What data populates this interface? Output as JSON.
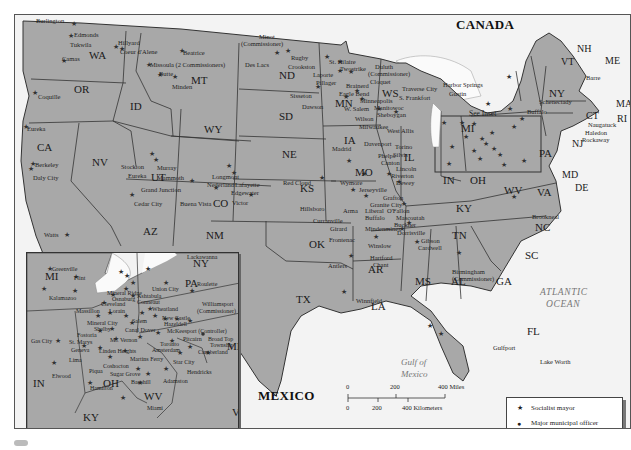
{
  "map": {
    "title": "Socialist municipal officials map of the United States",
    "colors": {
      "land_us": "#a8a8a8",
      "land_foreign": "#f2f2f2",
      "water": "#f7f7f7",
      "borders": "#333333",
      "text": "#222222",
      "ocean_label": "#777777"
    },
    "countries": {
      "canada": "CANADA",
      "mexico": "MEXICO"
    },
    "water_bodies": {
      "atlantic_1": "ATLANTIC",
      "atlantic_2": "OCEAN",
      "gulf_1": "Gulf of",
      "gulf_2": "Mexico"
    },
    "see_inset": "See Inset",
    "states": {
      "WA": "WA",
      "OR": "OR",
      "CA": "CA",
      "ID": "ID",
      "NV": "NV",
      "MT": "MT",
      "WY": "WY",
      "UT": "UT",
      "AZ": "AZ",
      "CO": "CO",
      "NM": "NM",
      "ND": "ND",
      "SD": "SD",
      "NE": "NE",
      "KS": "KS",
      "OK": "OK",
      "TX": "TX",
      "MN": "MN",
      "IA": "IA",
      "MO": "MO",
      "AR": "AR",
      "LA": "LA",
      "WS": "WS",
      "IL": "IL",
      "MI": "MI",
      "IN": "IN",
      "OH": "OH",
      "KY": "KY",
      "TN": "TN",
      "MS": "MS",
      "AL": "AL",
      "GA": "GA",
      "FL": "FL",
      "SC": "SC",
      "NC": "NC",
      "VA": "VA",
      "WV": "WV",
      "PA": "PA",
      "NY": "NY",
      "MD": "MD",
      "DE": "DE",
      "NJ": "NJ",
      "CT": "CT",
      "RI": "RI",
      "MA": "MA",
      "VT": "VT",
      "NH": "NH",
      "ME": "ME"
    },
    "cities": {
      "burlington": "Burlington",
      "edmonds": "Edmonds",
      "tukwila": "Tukwila",
      "camas": "Camas",
      "hillyard": "Hillyard",
      "coeur_d_alene": "Coeur d'Alene",
      "beatrice": "Beatrice",
      "missoula": "Missoula (2 Commissioners)",
      "butte": "Butte",
      "minden": "Minden",
      "coquille": "Coquille",
      "eureka_ca": "Eureka",
      "berkeley": "Berkeley",
      "daly_city": "Daly City",
      "watts": "Watts",
      "stockton": "Stockton",
      "murray": "Murray",
      "eureka_ut": "Eureka",
      "mammoth": "Mammoth",
      "grand_junction": "Grand Junction",
      "cedar_city": "Cedar City",
      "longmont": "Longmont",
      "nederland": "Nederland",
      "lafayette": "Lafayette",
      "edgewater": "Edgewater",
      "buena_vista": "Buena Vista",
      "victor": "Victor",
      "minot_1": "Minot",
      "minot_2": "(Commissioner)",
      "des_lacs": "Des Lacs",
      "rugby": "Rugby",
      "crookston": "Crookston",
      "st_hilaire": "St. Hilaire",
      "two_strike": "Twostrike",
      "laporte": "Laporte",
      "pillager": "Pillager",
      "brainerd": "Brainerd",
      "eagle_bend": "Eagle Bend",
      "sisseton": "Sisseton",
      "dawson": "Dawson",
      "minneapolis": "Minneapolis",
      "w_salem": "W. Salem",
      "duluth_1": "Duluth",
      "duluth_2": "(Commissioner)",
      "cloquet": "Cloquet",
      "traverse_city": "Traverse City",
      "s_frankfort": "S. Frankfort",
      "manitowoc": "Manitowoc",
      "sheboygan": "Sheboygan",
      "wilson": "Wilson",
      "milwaukee": "Milwaukee",
      "west_allis": "West Allis",
      "harbor_springs": "Harbor Springs",
      "gustin": "Gustin",
      "madrid": "Madrid",
      "davenport": "Davenport",
      "torino": "Torino",
      "sylvia": "Silvis",
      "phelps": "Phelps",
      "canton": "Canton",
      "lincoln": "Lincoln",
      "riverton": "Riverton",
      "dewey": "Dewey",
      "red_cloud": "Red Cloud",
      "wymore": "Wymore",
      "jerseyville": "Jerseyville",
      "grafton": "Grafton",
      "granite_city": "Granite City",
      "o_fallon": "O'Fallon",
      "liberal": "Liberal",
      "arma": "Arma",
      "buffalo_mo": "Buffalo",
      "mascoutah": "Mascoutah",
      "buckner": "Buckner",
      "dorrisville": "Dorrisville",
      "hillsboro": "Hillsboro",
      "curranville": "Curranville",
      "girard": "Girard",
      "mindenmines": "Mindenmines",
      "frontenac": "Frontenac",
      "winslow": "Winslow",
      "hartford": "Hartford",
      "chant": "Chant",
      "antlers": "Antlers",
      "gibson": "Gibson",
      "cardwell": "Cardwell",
      "winnfield": "Winnfield",
      "birmingham_1": "Birmingham",
      "birmingham_2": "(Commissioner)",
      "brookneal": "Brookneal",
      "gulfport": "Gulfport",
      "lake_worth": "Lake Worth",
      "schenectady": "Schenectady",
      "buffalo_ny": "Buffalo",
      "barre": "Barre",
      "naugatuck": "Naugatuck",
      "haledon": "Haledon",
      "rockaway": "Rockaway"
    },
    "inset": {
      "states": {
        "MI": "MI",
        "IN": "IN",
        "OH": "OH",
        "KY": "KY",
        "NY": "NY",
        "PA": "PA",
        "WV": "WV",
        "MD": "MD",
        "VA": "VA"
      },
      "cities": {
        "greenville": "Greenville",
        "flint": "Flint",
        "kalamazoo": "Kalamazoo",
        "mineral_ridge": "Mineral Ridge",
        "osnaburg": "Osnaburg",
        "cleveland": "Cleveland",
        "lorain": "Lorain",
        "massillon": "Massillon",
        "mineral_city": "Mineral City",
        "shelby": "Shelby",
        "salem": "Salem",
        "canal_dover": "Canal Dover",
        "fostoria": "Fostoria",
        "st_marys": "St. Marys",
        "mt_vernon": "Mt. Vernon",
        "gas_city": "Gas City",
        "geneva": "Geneva",
        "linden_heights": "Linden Heights",
        "lima": "Lima",
        "coshocton": "Coshocton",
        "elwood": "Elwood",
        "piqua": "Piqua",
        "sugar_grove": "Sugar Grove",
        "hamilton": "Hamilton",
        "barnhill": "Barnhill",
        "lackawanna": "Lackawanna",
        "union_city": "Union City",
        "roulette": "Roulette",
        "ashtabula": "Ashtabula",
        "conneaut": "Conneaut",
        "williamsport_1": "Williamsport",
        "williamsport_2": "(Commissioner)",
        "wheatland": "Wheatland",
        "new_castle": "New Castle",
        "hazeldell": "Hazeldell",
        "mckeesport": "McKeesport (Controller)",
        "pitcairn": "Pitcairn",
        "toronto": "Toronto",
        "amsterdam": "Amsterdam",
        "broad_top_1": "Broad Top",
        "broad_top_2": "Township",
        "martins_ferry": "Martins Ferry",
        "star_city": "Star City",
        "cumberland": "Cumberland",
        "hendricks": "Hendricks",
        "adamston": "Adamston",
        "miami": "Miami"
      }
    },
    "scale_bar": {
      "miles": [
        "0",
        "200",
        "400 Miles"
      ],
      "kilometers": [
        "0",
        "200",
        "400 Kilometers"
      ]
    },
    "legend": {
      "items": [
        {
          "symbol": "star",
          "label": "Socialist mayor"
        },
        {
          "symbol": "dot",
          "label_1": "Major municipal officer",
          "label_2": "other than mayor"
        }
      ]
    }
  }
}
